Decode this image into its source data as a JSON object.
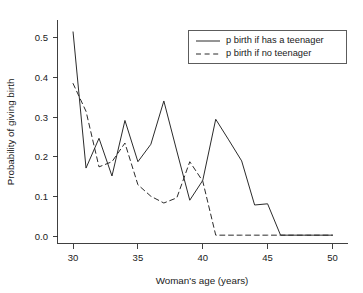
{
  "chart_data": {
    "type": "line",
    "title": "",
    "xlabel": "Woman's age (years)",
    "ylabel": "Probability of giving birth",
    "xlim": [
      28.8,
      51.2
    ],
    "ylim": [
      -0.018,
      0.545
    ],
    "grid": false,
    "legend_position": "top-right",
    "xticks": [
      30,
      35,
      40,
      45,
      50
    ],
    "xtick_labels": [
      "30",
      "35",
      "40",
      "45",
      "50"
    ],
    "yticks": [
      0.0,
      0.1,
      0.2,
      0.3,
      0.4,
      0.5
    ],
    "ytick_labels": [
      "0.0",
      "0.1",
      "0.2",
      "0.3",
      "0.4",
      "0.5"
    ],
    "x": [
      30,
      31,
      32,
      33,
      34,
      35,
      36,
      37,
      38,
      39,
      40,
      41,
      42,
      43,
      44,
      45,
      46,
      47,
      48,
      49,
      50
    ],
    "series": [
      {
        "name": "p birth if has a teenager",
        "style": "solid",
        "color": "#2b2b2b",
        "values": [
          0.515,
          0.172,
          0.247,
          0.152,
          0.292,
          0.188,
          0.232,
          0.341,
          0.215,
          0.091,
          0.141,
          0.295,
          0.243,
          0.19,
          0.079,
          0.082,
          0.003,
          0.003,
          0.003,
          0.003,
          0.003
        ]
      },
      {
        "name": "p birth if no teenager",
        "style": "dashed",
        "color": "#2b2b2b",
        "values": [
          0.385,
          0.315,
          0.175,
          0.188,
          0.235,
          0.13,
          0.101,
          0.084,
          0.097,
          0.188,
          0.139,
          0.003,
          0.003,
          0.003,
          0.003,
          0.003,
          0.003,
          0.003,
          0.003,
          0.003,
          0.003
        ]
      }
    ],
    "legend": [
      {
        "label": "p birth if has a teenager",
        "style": "solid"
      },
      {
        "label": "p birth if no teenager",
        "style": "dashed"
      }
    ]
  }
}
